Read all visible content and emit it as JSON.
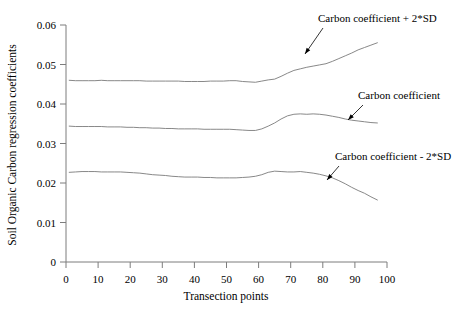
{
  "chart_data": {
    "type": "line",
    "title": "",
    "xlabel": "Transection points",
    "ylabel": "Soil Organic Carbon regression coefficients",
    "xlim": [
      0,
      100
    ],
    "ylim": [
      0,
      0.06
    ],
    "xticks": [
      0,
      10,
      20,
      30,
      40,
      50,
      60,
      70,
      80,
      90,
      100
    ],
    "xtick_labels": [
      "0",
      "10",
      "20",
      "30",
      "40",
      "50",
      "60",
      "70",
      "80",
      "90",
      "100"
    ],
    "yticks": [
      0,
      0.01,
      0.02,
      0.03,
      0.04,
      0.05,
      0.06
    ],
    "ytick_labels": [
      "0",
      "0.01",
      "0.02",
      "0.03",
      "0.04",
      "0.05",
      "0.06"
    ],
    "grid": false,
    "legend": "annotations-inline",
    "line_color": "#7a7a7a",
    "x": [
      1,
      3,
      5,
      7,
      9,
      11,
      13,
      15,
      17,
      19,
      21,
      23,
      25,
      27,
      29,
      31,
      33,
      35,
      37,
      39,
      41,
      43,
      45,
      47,
      49,
      51,
      53,
      55,
      57,
      59,
      61,
      63,
      65,
      67,
      69,
      71,
      73,
      75,
      77,
      79,
      81,
      83,
      85,
      87,
      89,
      91,
      93,
      95,
      97
    ],
    "series": [
      {
        "name": "Carbon coefficient + 2*SD",
        "values": [
          0.046,
          0.0459,
          0.0459,
          0.0459,
          0.0459,
          0.046,
          0.0459,
          0.0459,
          0.0459,
          0.0459,
          0.0459,
          0.0459,
          0.0458,
          0.0458,
          0.0458,
          0.0458,
          0.0458,
          0.0458,
          0.0457,
          0.0457,
          0.0457,
          0.0457,
          0.0458,
          0.0458,
          0.0458,
          0.0459,
          0.0459,
          0.0457,
          0.0456,
          0.0455,
          0.0458,
          0.0461,
          0.0463,
          0.047,
          0.0478,
          0.0485,
          0.0489,
          0.0493,
          0.0496,
          0.0499,
          0.0502,
          0.0508,
          0.0515,
          0.0522,
          0.0529,
          0.0537,
          0.0543,
          0.0549,
          0.0555
        ]
      },
      {
        "name": "Carbon coefficient",
        "values": [
          0.0344,
          0.0343,
          0.0343,
          0.0343,
          0.0343,
          0.0343,
          0.0342,
          0.0342,
          0.0342,
          0.0341,
          0.0341,
          0.034,
          0.034,
          0.0339,
          0.0339,
          0.0338,
          0.0338,
          0.0337,
          0.0337,
          0.0337,
          0.0337,
          0.0336,
          0.0336,
          0.0336,
          0.0336,
          0.0336,
          0.0335,
          0.0334,
          0.0333,
          0.0333,
          0.0337,
          0.0344,
          0.0352,
          0.0362,
          0.037,
          0.0374,
          0.0375,
          0.0374,
          0.0375,
          0.0374,
          0.0372,
          0.0369,
          0.0366,
          0.0362,
          0.0359,
          0.0357,
          0.0355,
          0.0353,
          0.0352
        ]
      },
      {
        "name": "Carbon coefficient - 2*SD",
        "values": [
          0.0227,
          0.0228,
          0.0229,
          0.0229,
          0.0229,
          0.0228,
          0.0228,
          0.0228,
          0.0228,
          0.0227,
          0.0226,
          0.0225,
          0.0223,
          0.0221,
          0.022,
          0.0219,
          0.0217,
          0.0216,
          0.0215,
          0.0215,
          0.0215,
          0.0214,
          0.0214,
          0.0213,
          0.0213,
          0.0213,
          0.0213,
          0.0214,
          0.0215,
          0.0217,
          0.0221,
          0.0227,
          0.023,
          0.0229,
          0.0228,
          0.0228,
          0.0229,
          0.0227,
          0.0225,
          0.0222,
          0.0218,
          0.0213,
          0.0206,
          0.0198,
          0.0189,
          0.0181,
          0.0174,
          0.0165,
          0.0157
        ]
      }
    ],
    "annotations": [
      {
        "id": "annot-upper",
        "text": "Carbon coefficient + 2*SD",
        "label_x": 318,
        "label_y": 22,
        "arrow_from_x": 323,
        "arrow_from_y": 28,
        "arrow_to_x": 305,
        "arrow_to_y": 54
      },
      {
        "id": "annot-middle",
        "text": "Carbon coefficient",
        "label_x": 358,
        "label_y": 99,
        "arrow_from_x": 363,
        "arrow_from_y": 105,
        "arrow_to_x": 348,
        "arrow_to_y": 120
      },
      {
        "id": "annot-lower",
        "text": "Carbon coefficient - 2*SD",
        "label_x": 335,
        "label_y": 160,
        "arrow_from_x": 339,
        "arrow_from_y": 166,
        "arrow_to_x": 327,
        "arrow_to_y": 180
      }
    ]
  }
}
